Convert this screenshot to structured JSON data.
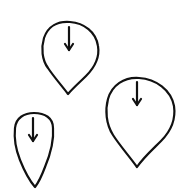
{
  "canvas": {
    "width": 191,
    "height": 195,
    "background": "#ffffff",
    "stroke_color": "#111111"
  },
  "shapes": [
    {
      "name": "pin-top-left",
      "type": "teardrop-with-down-arrow",
      "bounds": {
        "left": 42,
        "top": 21,
        "right": 99,
        "bottom": 95
      },
      "tip": [
        68,
        94
      ],
      "arrow": {
        "x": 69,
        "y1": 27,
        "y2": 51
      }
    },
    {
      "name": "pin-right",
      "type": "teardrop-with-down-arrow",
      "bounds": {
        "left": 106,
        "top": 77,
        "right": 174,
        "bottom": 167
      },
      "tip": [
        137,
        167
      ],
      "arrow": {
        "x": 137,
        "y1": 82,
        "y2": 106
      }
    },
    {
      "name": "pin-bottom-left",
      "type": "elongated-teardrop-with-down-arrow",
      "bounds": {
        "left": 14,
        "top": 112,
        "right": 54,
        "bottom": 187
      },
      "tip": [
        35,
        187
      ],
      "arrow": {
        "x": 33,
        "y1": 118,
        "y2": 142
      }
    }
  ]
}
